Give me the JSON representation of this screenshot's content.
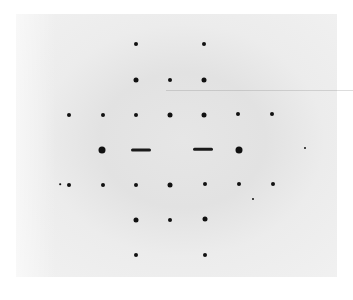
{
  "image": {
    "description": "Grayscale diffraction pattern photograph showing a rectangular lattice of dark spots on a light grey background, with two horizontal streaks on the central row",
    "background_color": "#e6e6e6",
    "spot_color": "#111111"
  },
  "spots": [
    {
      "x": 136,
      "y": 44,
      "r": 2
    },
    {
      "x": 204,
      "y": 44,
      "r": 2
    },
    {
      "x": 136,
      "y": 80,
      "r": 2.5
    },
    {
      "x": 170,
      "y": 80,
      "r": 2
    },
    {
      "x": 204,
      "y": 80,
      "r": 2.5
    },
    {
      "x": 69,
      "y": 115,
      "r": 2
    },
    {
      "x": 103,
      "y": 115,
      "r": 2
    },
    {
      "x": 136,
      "y": 115,
      "r": 2
    },
    {
      "x": 170,
      "y": 115,
      "r": 2.5
    },
    {
      "x": 204,
      "y": 115,
      "r": 2.5
    },
    {
      "x": 238,
      "y": 114,
      "r": 2
    },
    {
      "x": 272,
      "y": 114,
      "r": 2
    },
    {
      "x": 102,
      "y": 150,
      "r": 3.5
    },
    {
      "x": 239,
      "y": 150,
      "r": 3.5
    },
    {
      "x": 69,
      "y": 185,
      "r": 2
    },
    {
      "x": 103,
      "y": 185,
      "r": 2
    },
    {
      "x": 136,
      "y": 185,
      "r": 2
    },
    {
      "x": 170,
      "y": 185,
      "r": 2.5
    },
    {
      "x": 205,
      "y": 184,
      "r": 2
    },
    {
      "x": 239,
      "y": 184,
      "r": 2
    },
    {
      "x": 273,
      "y": 184,
      "r": 2
    },
    {
      "x": 136,
      "y": 220,
      "r": 2.5
    },
    {
      "x": 170,
      "y": 220,
      "r": 2
    },
    {
      "x": 205,
      "y": 219,
      "r": 2.5
    },
    {
      "x": 136,
      "y": 255,
      "r": 2
    },
    {
      "x": 205,
      "y": 255,
      "r": 2
    },
    {
      "x": 253,
      "y": 199,
      "r": 1
    },
    {
      "x": 60,
      "y": 184,
      "r": 0.8
    },
    {
      "x": 305,
      "y": 148,
      "r": 1
    }
  ],
  "streaks": [
    {
      "x": 141,
      "y": 150,
      "w": 20,
      "h": 3
    },
    {
      "x": 203,
      "y": 149,
      "w": 20,
      "h": 2.5
    }
  ]
}
